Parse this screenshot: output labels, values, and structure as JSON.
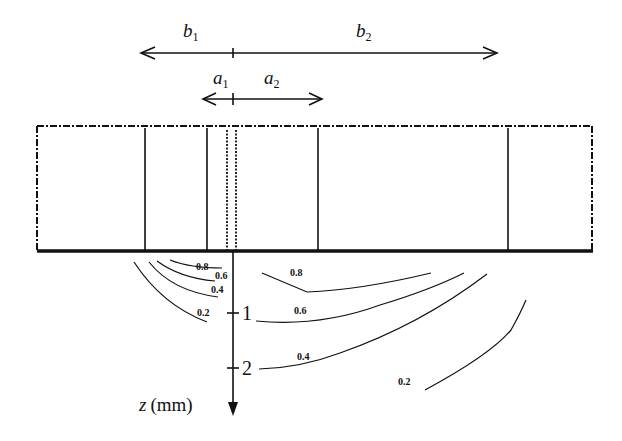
{
  "figure": {
    "dimension_arrows": {
      "b": {
        "left_label": "b",
        "left_sub": "1",
        "right_label": "b",
        "right_sub": "2"
      },
      "a": {
        "left_label": "a",
        "left_sub": "1",
        "right_label": "a",
        "right_sub": "2"
      }
    },
    "depth_axis": {
      "label_var": "z",
      "label_unit": "(mm)",
      "ticks": [
        "1",
        "2"
      ]
    },
    "contours": {
      "left_group": [
        "0.8",
        "0.6",
        "0.4",
        "0.2"
      ],
      "right_group": [
        "0.8",
        "0.6",
        "0.4",
        "0.2"
      ]
    },
    "colors": {
      "ink": "#111111",
      "background": "#ffffff"
    }
  }
}
